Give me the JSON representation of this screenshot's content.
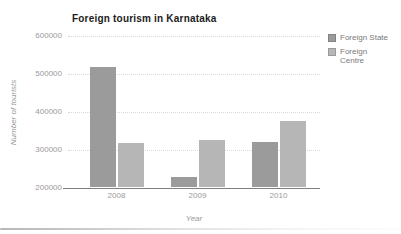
{
  "chart_data": {
    "type": "bar",
    "title": "Foreign tourism in Karnataka",
    "xlabel": "Year",
    "ylabel": "Number of tourists",
    "categories": [
      "2008",
      "2009",
      "2010"
    ],
    "series": [
      {
        "name": "Foreign State",
        "color": "#9b9b9b",
        "values": [
          516000,
          227000,
          321000
        ]
      },
      {
        "name": "Foreign Centre",
        "color": "#b6b6b6",
        "values": [
          316000,
          324000,
          376000
        ]
      }
    ],
    "ylim": [
      200000,
      600000
    ],
    "ytick_interval": 100000,
    "yticks": [
      "200000",
      "300000",
      "400000",
      "500000",
      "600000"
    ],
    "grid": true,
    "legend_position": "right"
  },
  "legend": {
    "items": [
      {
        "label": "Foreign State",
        "color": "#9b9b9b"
      },
      {
        "label": "Foreign\nCentre",
        "color": "#b6b6b6"
      }
    ]
  },
  "colors": {
    "background": "#ffffff",
    "title_text": "#1c1c1c",
    "tick_text": "#9a9a9a",
    "axis_title_text": "#9a9a9a",
    "axis_line": "#7f7f7f",
    "gridline": "#d9d9d9",
    "legend_text": "#7a7a7a"
  }
}
